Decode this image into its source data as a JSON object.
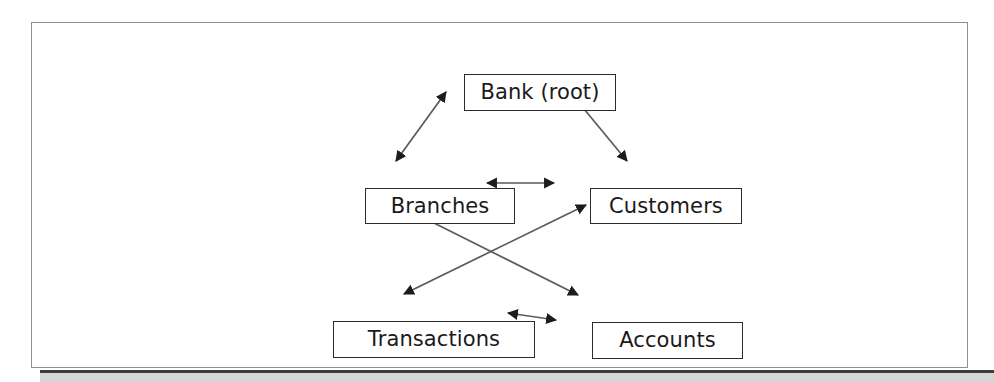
{
  "figure": {
    "type": "node-link-diagram",
    "background_color": "#ffffff",
    "frame_color": "#8f8f8f",
    "node_border_color": "#2b2b2b",
    "connector_color": "#555555",
    "band_color": "#d6d6d6"
  },
  "nodes": [
    {
      "id": "bank",
      "label": "Bank (root)",
      "level": "root"
    },
    {
      "id": "branches",
      "label": "Branches",
      "level": "middle"
    },
    {
      "id": "customers",
      "label": "Customers",
      "level": "middle"
    },
    {
      "id": "transactions",
      "label": "Transactions",
      "level": "leaf"
    },
    {
      "id": "accounts",
      "label": "Accounts",
      "level": "leaf"
    }
  ],
  "edges": [
    {
      "id": "bank-branches",
      "from": "bank",
      "to": "branches",
      "style": "double-arrow",
      "orientation": "diagonal"
    },
    {
      "id": "bank-customers",
      "from": "bank",
      "to": "customers",
      "style": "double-arrow",
      "orientation": "diagonal"
    },
    {
      "id": "branches-customers",
      "from": "branches",
      "to": "customers",
      "style": "double-arrow",
      "orientation": "horizontal"
    },
    {
      "id": "branches-accounts",
      "from": "branches",
      "to": "accounts",
      "style": "double-arrow",
      "orientation": "diagonal"
    },
    {
      "id": "customers-transactions",
      "from": "customers",
      "to": "transactions",
      "style": "double-arrow",
      "orientation": "diagonal"
    },
    {
      "id": "transactions-accounts",
      "from": "transactions",
      "to": "accounts",
      "style": "double-arrow",
      "orientation": "horizontal"
    }
  ]
}
